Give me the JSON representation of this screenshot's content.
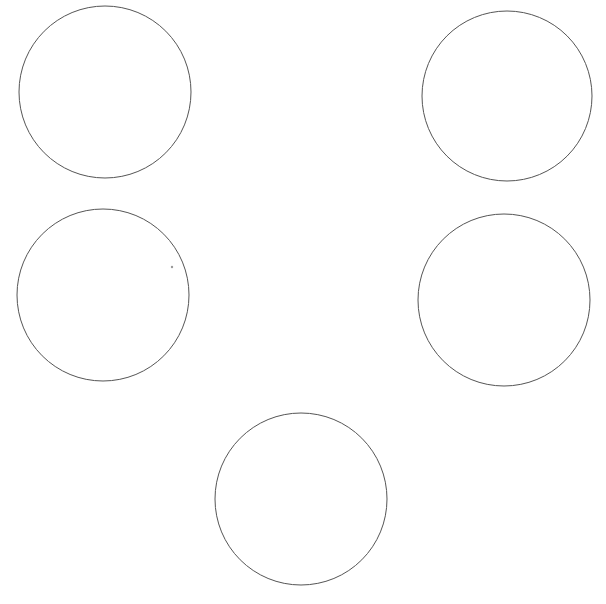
{
  "canvas": {
    "width": 606,
    "height": 604,
    "background": "#ffffff",
    "stroke_color": "#555555"
  },
  "shapes": [
    {
      "type": "circle",
      "label": "circle-top-left",
      "cx": 105,
      "cy": 92,
      "r": 86
    },
    {
      "type": "circle",
      "label": "circle-top-right",
      "cx": 507,
      "cy": 96,
      "r": 85
    },
    {
      "type": "circle",
      "label": "circle-middle-left",
      "cx": 103,
      "cy": 295,
      "r": 86
    },
    {
      "type": "circle",
      "label": "circle-middle-right",
      "cx": 504,
      "cy": 300,
      "r": 86
    },
    {
      "type": "circle",
      "label": "circle-bottom-center",
      "cx": 301,
      "cy": 499,
      "r": 86
    }
  ],
  "marks": [
    {
      "type": "dot",
      "label": "stray-dot",
      "cx": 172,
      "cy": 267,
      "r": 1.2,
      "color": "#999999"
    }
  ]
}
